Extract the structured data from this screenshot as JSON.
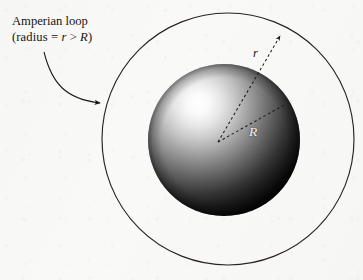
{
  "figure": {
    "background_color": "#f9f9f8",
    "ink_color": "#17130f"
  },
  "annotation": {
    "line1": "Amperian loop",
    "line2_prefix": "(radius = ",
    "line2_var_r": "r",
    "line2_operator": " > ",
    "line2_var_R": "R",
    "line2_suffix": ")",
    "pointer": "curved-arrow-to-outer-circle"
  },
  "labels": {
    "radius_outer": "r",
    "radius_sphere": "R"
  },
  "geometry": {
    "outer_circle": {
      "name": "amperian-loop",
      "center_x": 228,
      "center_y": 139,
      "radius": 126,
      "stroke": "#26201b",
      "stroke_width": 1.1,
      "fill": "none"
    },
    "sphere": {
      "name": "shaded-sphere",
      "center_x": 224,
      "center_y": 140,
      "radius": 76,
      "highlight_x_pct": 33,
      "highlight_y_pct": 26,
      "highlight_color": "#ffffff",
      "mid_color": "#8e8e8e",
      "edge_color": "#0b0b0b"
    },
    "center_point": {
      "x": 218,
      "y": 142
    },
    "arrow_r": {
      "name": "radius-r-dashed-arrow",
      "from_x": 218,
      "from_y": 142,
      "to_x": 282,
      "to_y": 33,
      "style": "dashed",
      "arrowhead": true
    },
    "arrow_R": {
      "name": "radius-R-dashed-line",
      "from_x": 218,
      "from_y": 142,
      "to_x": 285,
      "to_y": 105,
      "style": "dashed",
      "arrowhead": false
    },
    "callout_curve": {
      "name": "callout-curved-arrow",
      "start_x": 44,
      "start_y": 52,
      "ctrl1_x": 52,
      "ctrl1_y": 84,
      "ctrl2_x": 72,
      "ctrl2_y": 100,
      "end_x": 103,
      "end_y": 103,
      "arrowhead": true
    }
  }
}
